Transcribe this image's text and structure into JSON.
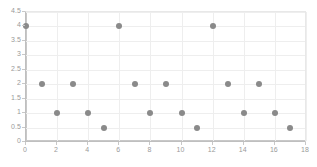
{
  "chart_data": {
    "type": "scatter",
    "title": "",
    "subtitle": "",
    "xlabel": "",
    "ylabel": "",
    "xlim": [
      0,
      18
    ],
    "ylim": [
      0,
      4.5
    ],
    "grid": true,
    "legend": false,
    "legend_position": "none",
    "marker_color": "#8a8a8a",
    "gridline_color": "#eeeeee",
    "axis_color": "#c8c8c8",
    "tick_label_color": "#9a9a9a",
    "x_ticks": [
      0,
      2,
      4,
      6,
      8,
      10,
      12,
      14,
      16,
      18
    ],
    "x_tick_labels": [
      "0",
      "2",
      "4",
      "6",
      "8",
      "10",
      "12",
      "14",
      "16",
      "18"
    ],
    "y_ticks": [
      0,
      0.5,
      1,
      1.5,
      2,
      2.5,
      3,
      3.5,
      4,
      4.5
    ],
    "y_tick_labels": [
      "0",
      "0.5",
      "1",
      "1.5",
      "2",
      "2.5",
      "3",
      "3.5",
      "4",
      "4.5"
    ],
    "x": [
      0,
      1,
      2,
      3,
      4,
      5,
      6,
      7,
      8,
      9,
      10,
      11,
      12,
      13,
      14,
      15,
      16,
      17
    ],
    "y": [
      4,
      2,
      1,
      2,
      1,
      0.5,
      4,
      2,
      1,
      2,
      1,
      0.5,
      4,
      2,
      1,
      2,
      1,
      0.5
    ],
    "points": [
      {
        "x": 0,
        "y": 4
      },
      {
        "x": 1,
        "y": 2
      },
      {
        "x": 2,
        "y": 1
      },
      {
        "x": 3,
        "y": 2
      },
      {
        "x": 4,
        "y": 1
      },
      {
        "x": 5,
        "y": 0.5
      },
      {
        "x": 6,
        "y": 4
      },
      {
        "x": 7,
        "y": 2
      },
      {
        "x": 8,
        "y": 1
      },
      {
        "x": 9,
        "y": 2
      },
      {
        "x": 10,
        "y": 1
      },
      {
        "x": 11,
        "y": 0.5
      },
      {
        "x": 12,
        "y": 4
      },
      {
        "x": 13,
        "y": 2
      },
      {
        "x": 14,
        "y": 1
      },
      {
        "x": 15,
        "y": 2
      },
      {
        "x": 16,
        "y": 1
      },
      {
        "x": 17,
        "y": 0.5
      }
    ]
  }
}
